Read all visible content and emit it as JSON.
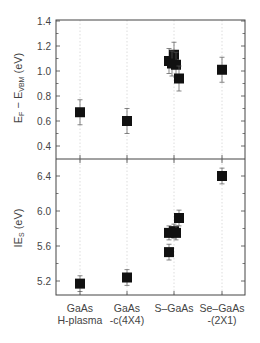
{
  "chart_data": {
    "type": "scatter",
    "layout": "two stacked panels sharing x-axis",
    "categories": [
      "GaAs\nH-plasma",
      "GaAs\n-c(4X4)",
      "S–GaAs",
      "Se–GaAs\n-(2X1)"
    ],
    "x_tick_labels": [
      [
        "GaAs",
        "H-plasma"
      ],
      [
        "GaAs",
        "-c(4X4)"
      ],
      [
        "S–GaAs"
      ],
      [
        "Se–GaAs",
        "-(2X1)"
      ]
    ],
    "grid": "vertical dotted lines at each category",
    "legend": "none",
    "marker": "filled square with error bars",
    "color": "#111111",
    "panels": [
      {
        "name": "top",
        "ylabel": "E_F − E_VBM (eV)",
        "ylabel_main": "E",
        "ylabel_sub1": "F",
        "ylabel_mid": " − E",
        "ylabel_sub2": "VBM",
        "ylabel_tail": " (eV)",
        "ylim": [
          0.3,
          1.42
        ],
        "yticks": [
          0.4,
          0.6,
          0.8,
          1.0,
          1.2,
          1.4
        ],
        "ytick_labels": [
          "0.4",
          "0.6",
          "0.8",
          "1.0",
          "1.2",
          "1.4"
        ],
        "points": [
          {
            "category": 0,
            "dx": 0,
            "y": 0.67,
            "err": 0.1
          },
          {
            "category": 1,
            "dx": 0,
            "y": 0.6,
            "err": 0.1
          },
          {
            "category": 2,
            "dx": -5,
            "y": 1.08,
            "err": 0.1
          },
          {
            "category": 2,
            "dx": 0,
            "y": 1.13,
            "err": 0.1
          },
          {
            "category": 2,
            "dx": -2,
            "y": 1.06,
            "err": 0.1
          },
          {
            "category": 2,
            "dx": 2,
            "y": 1.05,
            "err": 0.1
          },
          {
            "category": 2,
            "dx": 5,
            "y": 0.94,
            "err": 0.1
          },
          {
            "category": 3,
            "dx": 0,
            "y": 1.01,
            "err": 0.1
          }
        ]
      },
      {
        "name": "bottom",
        "ylabel": "IE_S (eV)",
        "ylabel_main": "IE",
        "ylabel_sub1": "S",
        "ylabel_tail": " (eV)",
        "ylim": [
          5.04,
          6.57
        ],
        "yticks": [
          5.2,
          5.6,
          6.0,
          6.4
        ],
        "ytick_labels": [
          "5.2",
          "5.6",
          "6.0",
          "6.4"
        ],
        "points": [
          {
            "category": 0,
            "dx": 0,
            "y": 5.17,
            "err": 0.09
          },
          {
            "category": 1,
            "dx": 0,
            "y": 5.24,
            "err": 0.09
          },
          {
            "category": 2,
            "dx": -5,
            "y": 5.53,
            "err": 0.09
          },
          {
            "category": 2,
            "dx": -5,
            "y": 5.75,
            "err": 0.08
          },
          {
            "category": 2,
            "dx": 0,
            "y": 5.77,
            "err": 0.08
          },
          {
            "category": 2,
            "dx": 2,
            "y": 5.75,
            "err": 0.08
          },
          {
            "category": 2,
            "dx": 5,
            "y": 5.92,
            "err": 0.09
          },
          {
            "category": 3,
            "dx": 0,
            "y": 6.4,
            "err": 0.09
          }
        ]
      }
    ]
  }
}
